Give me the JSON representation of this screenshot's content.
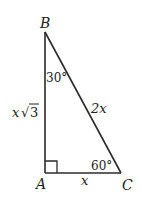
{
  "diagram": {
    "type": "right-triangle",
    "colors": {
      "stroke": "#2b2b2b",
      "text": "#222222",
      "background": "#ffffff"
    },
    "vertices": {
      "B": {
        "label": "B"
      },
      "A": {
        "label": "A"
      },
      "C": {
        "label": "C"
      }
    },
    "angles": {
      "B": {
        "label": "30°"
      },
      "C": {
        "label": "60°"
      },
      "A": {
        "marker": "right-angle"
      }
    },
    "sides": {
      "AB": {
        "label_var": "x",
        "label_radical": "√",
        "label_radicand": "3"
      },
      "BC": {
        "label": "2x"
      },
      "AC": {
        "label": "x"
      }
    }
  }
}
